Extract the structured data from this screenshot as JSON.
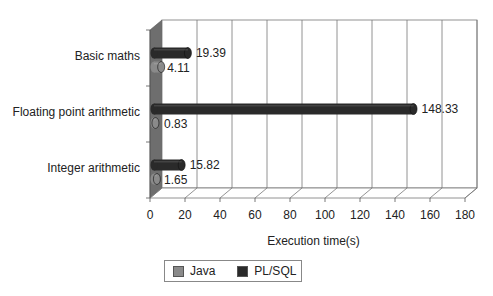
{
  "chart_data": {
    "type": "bar",
    "orientation": "horizontal",
    "style": "3d-cylinder",
    "title": "",
    "xlabel": "Execution time(s)",
    "ylabel": "",
    "xlim": [
      0,
      180
    ],
    "xticks": [
      0,
      20,
      40,
      60,
      80,
      100,
      120,
      140,
      160,
      180
    ],
    "categories": [
      "Basic maths",
      "Floating point arithmetic",
      "Integer arithmetic"
    ],
    "series": [
      {
        "name": "Java",
        "color": "#8a8a8a",
        "values": [
          4.11,
          0.83,
          1.65
        ]
      },
      {
        "name": "PL/SQL",
        "color": "#2a2a2a",
        "values": [
          19.39,
          148.33,
          15.82
        ]
      }
    ],
    "data_labels": {
      "Java": [
        "4.11",
        "0.83",
        "1.65"
      ],
      "PL/SQL": [
        "19.39",
        "148.33",
        "15.82"
      ]
    },
    "grid": true,
    "legend_position": "bottom"
  },
  "legend": {
    "items": [
      {
        "label": "Java",
        "color": "#8a8a8a"
      },
      {
        "label": "PL/SQL",
        "color": "#2a2a2a"
      }
    ]
  }
}
